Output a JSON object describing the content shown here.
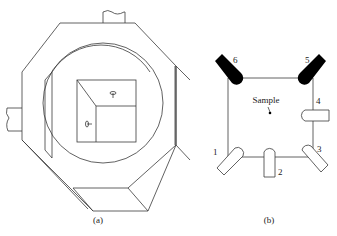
{
  "figure": {
    "panel_a": {
      "caption": "(a)",
      "description": "Octagonal chamber with cylindrical bore and sample cube"
    },
    "panel_b": {
      "caption": "(b)",
      "sample_label": "Sample",
      "detectors": [
        {
          "id": "1",
          "label": "1",
          "style": "outline"
        },
        {
          "id": "2",
          "label": "2",
          "style": "outline"
        },
        {
          "id": "3",
          "label": "3",
          "style": "outline"
        },
        {
          "id": "4",
          "label": "4",
          "style": "outline"
        },
        {
          "id": "5",
          "label": "5",
          "style": "filled"
        },
        {
          "id": "6",
          "label": "6",
          "style": "filled"
        }
      ]
    },
    "colors": {
      "line": "#3a3a3a",
      "filled_detector": "#000000",
      "background": "#ffffff"
    }
  }
}
